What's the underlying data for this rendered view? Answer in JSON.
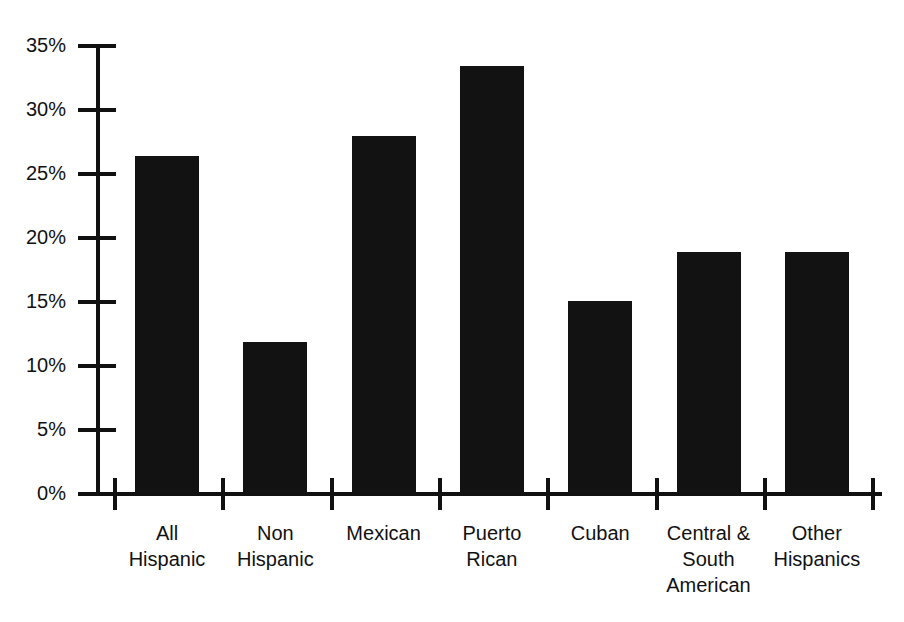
{
  "chart_data": {
    "type": "bar",
    "title": "",
    "subtitle": "",
    "xlabel": "",
    "ylabel": "",
    "ylim": [
      0,
      35
    ],
    "ytick_step": 5,
    "grid": false,
    "legend": false,
    "legend_position": "none",
    "bar_color": "#121212",
    "axis_color": "#111111",
    "background": "#ffffff",
    "value_suffix": "%",
    "ytick_labels": [
      "0%",
      "5%",
      "10%",
      "15%",
      "20%",
      "25%",
      "30%",
      "35%"
    ],
    "ytick_values": [
      0,
      5,
      10,
      15,
      20,
      25,
      30,
      35
    ],
    "categories": [
      "All Hispanic",
      "Non Hispanic",
      "Mexican",
      "Puerto Rican",
      "Cuban",
      "Central & South American",
      "Other Hispanics"
    ],
    "category_lines": [
      [
        "All",
        "Hispanic"
      ],
      [
        "Non",
        "Hispanic"
      ],
      [
        "Mexican"
      ],
      [
        "Puerto",
        "Rican"
      ],
      [
        "Cuban"
      ],
      [
        "Central &",
        "South",
        "American"
      ],
      [
        "Other",
        "Hispanics"
      ]
    ],
    "values": [
      26.4,
      11.9,
      28.0,
      33.4,
      15.1,
      18.9,
      18.9
    ]
  }
}
